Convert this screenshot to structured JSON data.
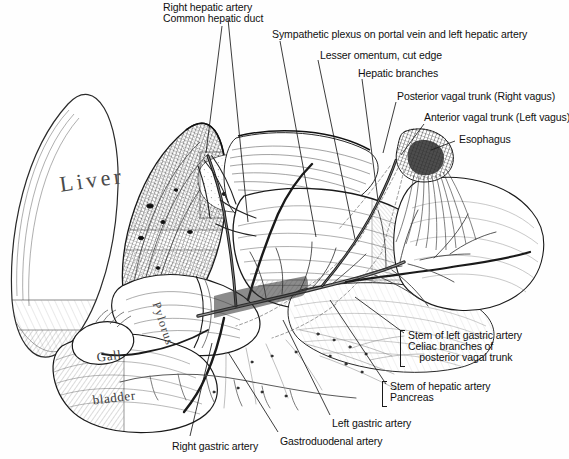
{
  "figure": {
    "kind": "anatomical-illustration",
    "style": "pen-and-ink line drawing with cross-hatch shading",
    "background_color": "#fefefe",
    "ink_color": "#1a1a1a"
  },
  "inline_labels": [
    {
      "id": "liver",
      "text": "Liver"
    },
    {
      "id": "gall",
      "line1": "Gall",
      "line2": "bladder"
    },
    {
      "id": "pylorus",
      "text": "Pylorus"
    }
  ],
  "callouts": [
    {
      "id": "right-hepatic-artery",
      "lines": [
        "Right hepatic artery"
      ],
      "x": 163,
      "y": 2
    },
    {
      "id": "common-hepatic-duct",
      "lines": [
        "Common hepatic duct"
      ],
      "x": 163,
      "y": 13
    },
    {
      "id": "sympathetic-plexus",
      "lines": [
        "Sympathetic plexus on portal vein and left hepatic artery"
      ],
      "x": 272,
      "y": 29
    },
    {
      "id": "lesser-omentum",
      "lines": [
        "Lesser omentum, cut edge"
      ],
      "x": 320,
      "y": 50
    },
    {
      "id": "hepatic-branches",
      "lines": [
        "Hepatic branches"
      ],
      "x": 358,
      "y": 68
    },
    {
      "id": "posterior-vagal-trunk",
      "lines": [
        "Posterior vagal trunk (Right vagus)"
      ],
      "x": 397,
      "y": 91
    },
    {
      "id": "anterior-vagal-trunk",
      "lines": [
        "Anterior vagal trunk (Left vagus)"
      ],
      "x": 424,
      "y": 112
    },
    {
      "id": "esophagus",
      "lines": [
        "Esophagus"
      ],
      "x": 459,
      "y": 134
    },
    {
      "id": "stem-left-gastric-celiac",
      "lines": [
        "Stem of left gastric artery",
        "Celiac branches of",
        "    posterior vagal trunk"
      ],
      "x": 408,
      "y": 330,
      "bracket": true
    },
    {
      "id": "stem-hepatic-pancreas",
      "lines": [
        "Stem of hepatic artery",
        "Pancreas"
      ],
      "x": 390,
      "y": 381,
      "bracket": true
    },
    {
      "id": "left-gastric-artery",
      "lines": [
        "Left gastric artery"
      ],
      "x": 332,
      "y": 418
    },
    {
      "id": "gastroduodenal-artery",
      "lines": [
        "Gastroduodenal artery"
      ],
      "x": 280,
      "y": 436
    },
    {
      "id": "right-gastric-artery",
      "lines": [
        "Right gastric artery"
      ],
      "x": 172,
      "y": 441
    }
  ],
  "leader_lines": [
    {
      "id": "leader-right-hepatic-artery",
      "x1": 228,
      "y1": 19,
      "x2": 248,
      "y2": 222
    },
    {
      "id": "leader-common-hepatic-duct",
      "x1": 222,
      "y1": 26,
      "x2": 206,
      "y2": 153
    },
    {
      "id": "leader-sympathetic-plexus",
      "x1": 280,
      "y1": 41,
      "x2": 316,
      "y2": 237
    },
    {
      "id": "leader-lesser-omentum",
      "x1": 318,
      "y1": 60,
      "x2": 355,
      "y2": 239
    },
    {
      "id": "leader-hepatic-branches",
      "x1": 362,
      "y1": 79,
      "x2": 378,
      "y2": 200
    },
    {
      "id": "leader-posterior-vagal",
      "x1": 396,
      "y1": 102,
      "x2": 383,
      "y2": 153
    },
    {
      "id": "leader-anterior-vagal",
      "x1": 424,
      "y1": 124,
      "x2": 401,
      "y2": 155
    },
    {
      "id": "leader-esophagus",
      "x1": 455,
      "y1": 141,
      "x2": 431,
      "y2": 150
    },
    {
      "id": "leader-stem-left-gastric",
      "x1": 404,
      "y1": 333,
      "x2": 355,
      "y2": 297
    },
    {
      "id": "leader-stem-hepatic",
      "x1": 386,
      "y1": 384,
      "x2": 330,
      "y2": 300
    },
    {
      "id": "leader-left-gastric-artery",
      "x1": 330,
      "y1": 415,
      "x2": 283,
      "y2": 320
    },
    {
      "id": "leader-gastroduodenal-artery",
      "x1": 278,
      "y1": 432,
      "x2": 228,
      "y2": 352
    },
    {
      "id": "leader-right-gastric-artery",
      "x1": 190,
      "y1": 436,
      "x2": 212,
      "y2": 343
    }
  ]
}
